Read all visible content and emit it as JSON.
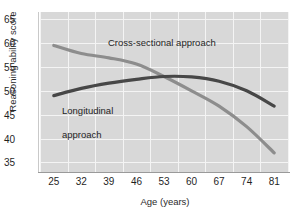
{
  "chart_data": {
    "type": "line",
    "title": "",
    "xlabel": "Age (years)",
    "ylabel": "Reasoning ability score",
    "xticks": [
      25,
      32,
      39,
      46,
      53,
      60,
      67,
      74,
      81
    ],
    "yticks": [
      35,
      40,
      45,
      50,
      55,
      60,
      65
    ],
    "xlim": [
      21.5,
      84.5
    ],
    "ylim": [
      33.0,
      66.5
    ],
    "grid": true,
    "legend_position": "inline-annotations",
    "x": [
      25,
      32,
      39,
      46,
      53,
      60,
      67,
      74,
      81
    ],
    "series": [
      {
        "name": "Cross-sectional approach",
        "color": "#8d8d8d",
        "values": [
          59.5,
          57.8,
          56.9,
          55.6,
          53.0,
          50.0,
          46.8,
          42.5,
          37.0
        ]
      },
      {
        "name": "Longitudinal approach",
        "color": "#474747",
        "values": [
          49.0,
          50.5,
          51.6,
          52.4,
          53.0,
          52.9,
          52.0,
          50.0,
          46.8
        ]
      }
    ],
    "annotations": [
      {
        "text": "Cross-sectional approach",
        "near_x": 39,
        "near_y": 58.5
      },
      {
        "text": "Longitudinal approach",
        "near_x": 32,
        "near_y": 47.5
      }
    ]
  },
  "labels": {
    "annotation_cross": "Cross-sectional approach",
    "annotation_long_line1": "Longitudinal",
    "annotation_long_line2": "approach"
  },
  "colors": {
    "plot_background": "#d8d8d8",
    "gridline": "#f4f4f4",
    "axis": "#9a9a9a",
    "cross_sectional": "#8d8d8d",
    "longitudinal": "#474747",
    "text": "#1f1f1f"
  }
}
